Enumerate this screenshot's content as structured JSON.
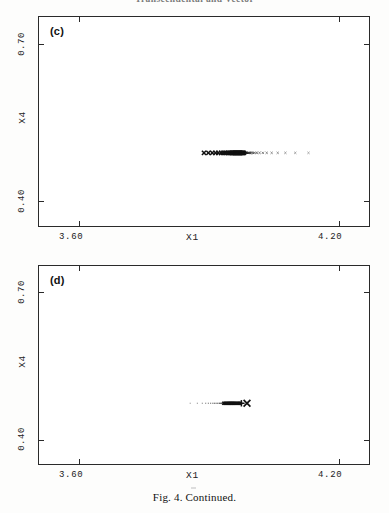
{
  "header": {
    "running_head": "Transcendental and Vector"
  },
  "caption": {
    "text": "Fig. 4.  Continued."
  },
  "panels": [
    {
      "id": "c",
      "label": "(c)",
      "x_axis": {
        "title": "X1",
        "min_label": "3.60",
        "max_label": "4.20",
        "min": 3.6,
        "max": 4.2
      },
      "y_axis": {
        "title": "X4",
        "min_label": "0.40",
        "max_label": "0.70",
        "min": 0.4,
        "max": 0.7
      }
    },
    {
      "id": "d",
      "label": "(d)",
      "x_axis": {
        "title": "X1",
        "min_label": "3.60",
        "max_label": "4.20",
        "min": 3.6,
        "max": 4.2
      },
      "y_axis": {
        "title": "X4",
        "min_label": "0.40",
        "max_label": "0.70",
        "min": 0.4,
        "max": 0.7
      }
    }
  ],
  "chart_data": [
    {
      "type": "scatter",
      "title": "(c)",
      "xlabel": "X1",
      "ylabel": "X4",
      "xlim": [
        3.6,
        4.2
      ],
      "ylim": [
        0.4,
        0.7
      ],
      "xticks": [
        3.6,
        4.2
      ],
      "yticks": [
        0.4,
        0.7
      ],
      "grid": false,
      "legend": "none",
      "marker": "x",
      "note": "Dense horizontal cluster of overlapping x-markers on a single X4 level, with a sparse tail of isolated points trailing to the right.",
      "series": [
        {
          "name": "attractor points",
          "x": [
            3.9,
            3.908,
            3.915,
            3.921,
            3.926,
            3.931,
            3.935,
            3.938,
            3.941,
            3.944,
            3.946,
            3.948,
            3.95,
            3.951,
            3.952,
            3.953,
            3.954,
            3.955,
            3.956,
            3.957,
            3.958,
            3.959,
            3.96,
            3.961,
            3.962,
            3.963,
            3.964,
            3.965,
            3.966,
            3.967,
            3.968,
            3.969,
            3.97,
            3.971,
            3.972,
            3.973,
            3.974,
            3.975,
            3.976,
            3.977,
            3.978,
            3.98,
            3.982,
            3.984,
            3.986,
            3.989,
            3.992,
            3.996,
            4.001,
            4.007,
            4.014,
            4.023,
            4.034,
            4.048,
            4.066,
            4.09
          ],
          "y": [
            0.505,
            0.505,
            0.505,
            0.505,
            0.505,
            0.505,
            0.505,
            0.505,
            0.505,
            0.505,
            0.505,
            0.505,
            0.505,
            0.505,
            0.505,
            0.505,
            0.505,
            0.505,
            0.505,
            0.505,
            0.505,
            0.505,
            0.505,
            0.505,
            0.505,
            0.505,
            0.505,
            0.505,
            0.505,
            0.505,
            0.505,
            0.505,
            0.505,
            0.505,
            0.505,
            0.505,
            0.505,
            0.505,
            0.505,
            0.505,
            0.505,
            0.505,
            0.505,
            0.505,
            0.505,
            0.505,
            0.505,
            0.505,
            0.505,
            0.505,
            0.505,
            0.505,
            0.505,
            0.505,
            0.505,
            0.505
          ]
        }
      ]
    },
    {
      "type": "scatter",
      "title": "(d)",
      "xlabel": "X1",
      "ylabel": "X4",
      "xlim": [
        3.6,
        4.2
      ],
      "ylim": [
        0.4,
        0.7
      ],
      "xticks": [
        3.6,
        4.2
      ],
      "yticks": [
        0.4,
        0.7
      ],
      "grid": false,
      "legend": "none",
      "marker": "x",
      "note": "Sparse dotted points at left converging into a solid dense segment that terminates in a plus marker and a bold x marker at the right end.",
      "series": [
        {
          "name": "attractor points",
          "x": [
            3.875,
            3.888,
            3.897,
            3.903,
            3.908,
            3.912,
            3.916,
            3.919,
            3.922,
            3.925,
            3.928,
            3.93,
            3.932,
            3.934,
            3.936,
            3.938,
            3.94,
            3.942,
            3.944,
            3.946,
            3.948,
            3.95,
            3.952,
            3.954,
            3.956,
            3.958,
            3.96,
            3.962,
            3.964,
            3.966,
            3.968,
            3.97
          ],
          "y": [
            0.492,
            0.492,
            0.492,
            0.492,
            0.492,
            0.492,
            0.492,
            0.492,
            0.492,
            0.492,
            0.492,
            0.492,
            0.492,
            0.492,
            0.492,
            0.492,
            0.492,
            0.492,
            0.492,
            0.492,
            0.492,
            0.492,
            0.492,
            0.492,
            0.492,
            0.492,
            0.492,
            0.492,
            0.492,
            0.492,
            0.492,
            0.492
          ]
        }
      ]
    }
  ]
}
